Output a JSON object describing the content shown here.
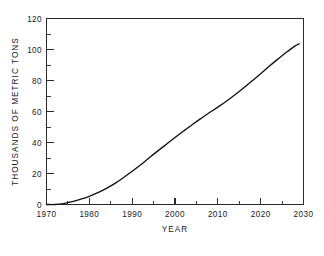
{
  "chart_data": {
    "type": "line",
    "title": "",
    "subtitle": "",
    "xlabel": "YEAR",
    "ylabel": "THOUSANDS OF METRIC TONS",
    "xlim": [
      1970,
      2030
    ],
    "ylim": [
      0,
      120
    ],
    "grid": false,
    "legend": null,
    "legend_position": "none",
    "x_major_ticks": [
      1970,
      1980,
      1990,
      2000,
      2010,
      2020,
      2030
    ],
    "x_tick_labels": [
      "1970",
      "1980",
      "1990",
      "2000",
      "2010",
      "2020",
      "2030"
    ],
    "x_minor_tick_step": 5,
    "y_major_ticks": [
      0,
      20,
      40,
      60,
      80,
      100,
      120
    ],
    "y_tick_labels": [
      "0",
      "20",
      "40",
      "60",
      "80",
      "100",
      "120"
    ],
    "line_color": "#111111",
    "series": [
      {
        "name": "production",
        "x": [
          1970,
          1972,
          1974,
          1976,
          1978,
          1980,
          1982,
          1984,
          1986,
          1988,
          1990,
          1992,
          1994,
          1996,
          1998,
          2000,
          2002,
          2004,
          2006,
          2008,
          2010,
          2012,
          2014,
          2016,
          2018,
          2020,
          2022,
          2024,
          2026,
          2028,
          2029
        ],
        "values": [
          0,
          0,
          0.6,
          1.8,
          3.4,
          5.3,
          7.6,
          10.4,
          13.6,
          17.4,
          21.4,
          25.6,
          30.2,
          34.6,
          38.9,
          43.2,
          47.4,
          51.5,
          55.4,
          59.2,
          62.8,
          66.6,
          70.8,
          75.2,
          79.8,
          84.4,
          89.2,
          93.8,
          98.2,
          102.2,
          103.6
        ]
      }
    ]
  },
  "figure": {
    "background_color": "#ffffff",
    "frame_color": "#2b2b2b",
    "text_color": "#1a1a1a"
  }
}
